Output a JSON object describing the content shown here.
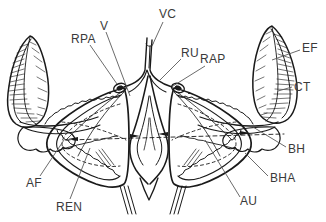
{
  "figure": {
    "background_color": "#ffffff",
    "ink_color": "#1a1a1a",
    "label_color": "#3a3a3a",
    "width": 326,
    "height": 222
  },
  "labels": [
    {
      "id": "V",
      "text": "V",
      "x": 100,
      "y": 20
    },
    {
      "id": "VC",
      "text": "VC",
      "x": 159,
      "y": 8
    },
    {
      "id": "RPA",
      "text": "RPA",
      "x": 71,
      "y": 33
    },
    {
      "id": "RU",
      "text": "RU",
      "x": 181,
      "y": 47
    },
    {
      "id": "RAP",
      "text": "RAP",
      "x": 200,
      "y": 53
    },
    {
      "id": "EF",
      "text": "EF",
      "x": 302,
      "y": 42
    },
    {
      "id": "CT",
      "text": "CT",
      "x": 294,
      "y": 81
    },
    {
      "id": "BH",
      "text": "BH",
      "x": 288,
      "y": 143
    },
    {
      "id": "BHA",
      "text": "BHA",
      "x": 270,
      "y": 172
    },
    {
      "id": "AU",
      "text": "AU",
      "x": 240,
      "y": 195
    },
    {
      "id": "AF",
      "text": "AF",
      "x": 26,
      "y": 177
    },
    {
      "id": "REN",
      "text": "REN",
      "x": 56,
      "y": 201
    }
  ],
  "leader_lines": [
    {
      "from": "V",
      "d": "M106,32 L130,96"
    },
    {
      "from": "VC",
      "d": "M163,22 L152,46"
    },
    {
      "from": "RPA",
      "d": "M90,45 L117,84"
    },
    {
      "from": "RU",
      "d": "M181,59 L160,80"
    },
    {
      "from": "RAP",
      "d": "M205,66 L173,86"
    },
    {
      "from": "EF",
      "d": "M300,50 L272,60"
    },
    {
      "from": "CT",
      "d": "M292,87 L278,91"
    },
    {
      "from": "BH",
      "d": "M286,147 L253,127"
    },
    {
      "from": "BHA",
      "d": "M268,176 L245,153"
    },
    {
      "from": "AU",
      "d": "M240,197 L205,140"
    },
    {
      "from": "AF",
      "d": "M40,176 L64,140"
    },
    {
      "from": "REN",
      "d": "M70,199 L90,148"
    }
  ],
  "structures": [
    {
      "name": "left-filament-blade",
      "note": "hatched leaf-shaped blade, left"
    },
    {
      "name": "right-filament-blade",
      "note": "hatched leaf-shaped blade, right"
    },
    {
      "name": "left-lobe",
      "note": "triangular lobe with crenate margin"
    },
    {
      "name": "right-lobe",
      "note": "triangular lobe with crenate margin"
    },
    {
      "name": "central-vessel",
      "note": "Y-bifurcating median tube"
    },
    {
      "name": "median-sac",
      "note": "spindle-shaped median body"
    },
    {
      "name": "left-basal-knob",
      "note": "lobed basal knob, left"
    },
    {
      "name": "right-basal-knob",
      "note": "lobed basal knob, right"
    }
  ]
}
